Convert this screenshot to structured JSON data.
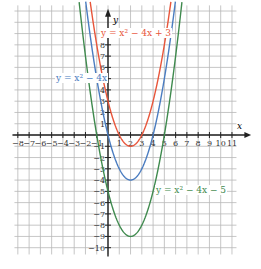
{
  "chart_data": {
    "type": "line",
    "title": "",
    "xlabel": "x",
    "ylabel": "y",
    "xlim": [
      -8,
      11
    ],
    "ylim": [
      -10,
      8
    ],
    "x_ticks": [
      -8,
      -7,
      -6,
      -5,
      -4,
      -3,
      -2,
      -1,
      1,
      2,
      3,
      4,
      5,
      6,
      7,
      8,
      9,
      10,
      11
    ],
    "y_ticks": [
      -10,
      -9,
      -8,
      -7,
      -6,
      -5,
      -4,
      -3,
      -2,
      -1,
      1,
      2,
      3,
      4,
      5,
      6,
      7,
      8
    ],
    "grid": true,
    "legend": "inline labels",
    "series": [
      {
        "name": "y = x² − 4x + 3",
        "color": "#e8553a",
        "a": 1,
        "b": -4,
        "c": 3,
        "vertex": [
          2,
          -1
        ],
        "roots": [
          1,
          3
        ]
      },
      {
        "name": "y = x² − 4x",
        "color": "#4a7cc0",
        "a": 1,
        "b": -4,
        "c": 0,
        "vertex": [
          2,
          -4
        ],
        "roots": [
          0,
          4
        ]
      },
      {
        "name": "y = x² − 4x − 5",
        "color": "#3f8a4e",
        "a": 1,
        "b": -4,
        "c": -5,
        "vertex": [
          2,
          -9
        ],
        "roots": [
          -1,
          5
        ]
      }
    ]
  },
  "labels": {
    "red": "y = x² − 4x + 3",
    "blue": "y = x² − 4x",
    "green": "y = x² − 4x − 5",
    "x_axis": "x",
    "y_axis": "y"
  }
}
